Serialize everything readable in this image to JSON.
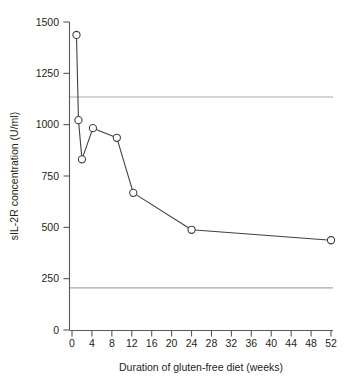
{
  "chart_data": {
    "type": "line",
    "title": "",
    "xlabel": "Duration of gluten-free diet (weeks)",
    "ylabel": "sIL-2R concentration (U/ml)",
    "xlim": [
      0,
      52
    ],
    "ylim": [
      0,
      1500
    ],
    "grid": false,
    "legend": null,
    "marker": "open-circle",
    "x": [
      0.9,
      1.3,
      2.0,
      4.2,
      9.0,
      12.3,
      24.0,
      52.0
    ],
    "values": [
      1437,
      1022,
      831,
      983,
      936,
      668,
      488,
      437
    ],
    "series": [
      {
        "name": "sIL-2R concentration",
        "x": [
          0.9,
          1.3,
          2.0,
          4.2,
          9.0,
          12.3,
          24.0,
          52.0
        ],
        "values": [
          1437,
          1022,
          831,
          983,
          936,
          668,
          488,
          437
        ]
      }
    ],
    "xticks": [
      0,
      4,
      8,
      12,
      16,
      20,
      24,
      28,
      32,
      36,
      40,
      44,
      48,
      52
    ],
    "xticklabels": [
      "0",
      "4",
      "8",
      "12",
      "16",
      "20",
      "24",
      "28",
      "32",
      "36",
      "40",
      "44",
      "48",
      "52"
    ],
    "yticks": [
      0,
      250,
      500,
      750,
      1000,
      1250,
      1500
    ],
    "yticklabels": [
      "0",
      "250",
      "500",
      "750",
      "1000",
      "1250",
      "1500"
    ],
    "reference_lines": [
      {
        "name": "upper-reference",
        "value": 1135,
        "orientation": "horizontal",
        "color": "#a7a9ac"
      },
      {
        "name": "lower-reference",
        "value": 205,
        "orientation": "horizontal",
        "color": "#a7a9ac"
      }
    ],
    "colors": {
      "series": "#414042",
      "axis": "#58595b",
      "reference": "#a7a9ac",
      "background": "#ffffff"
    }
  }
}
